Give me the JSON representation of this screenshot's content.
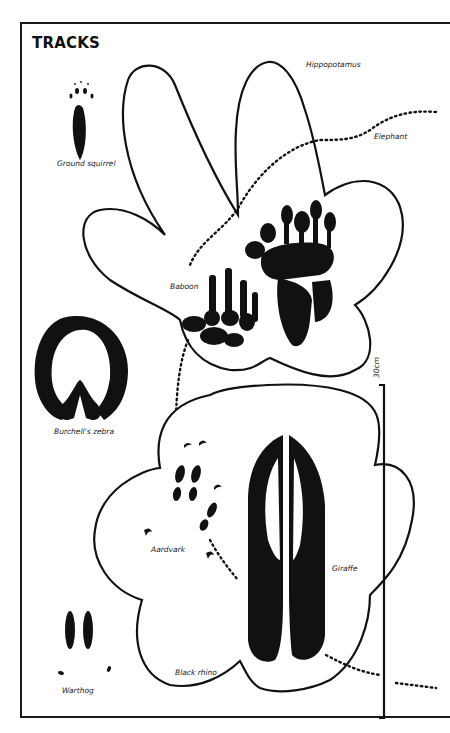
{
  "page": {
    "title": "TRACKS"
  },
  "labels": {
    "ground_squirrel": "Ground squirrel",
    "hippopotamus": "Hippopotamus",
    "elephant": "Elephant",
    "baboon": "Baboon",
    "burchells_zebra": "Burchell's zebra",
    "aardvark": "Aardvark",
    "giraffe": "Giraffe",
    "black_rhino": "Black rhino",
    "warthog": "Warthog"
  },
  "scale": {
    "label": "30cm"
  },
  "colors": {
    "ink": "#111111",
    "paper": "#ffffff"
  }
}
